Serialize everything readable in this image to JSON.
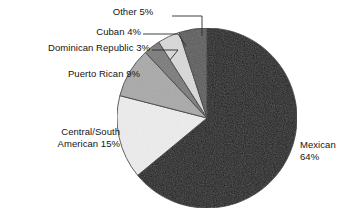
{
  "chart_data": {
    "type": "pie",
    "title": "",
    "subtitle": "",
    "xlabel": "",
    "ylabel": "",
    "grid": false,
    "legend_position": "none",
    "label_format": "{name} {value}%",
    "total": 100,
    "units": "percent",
    "start_angle_deg": 0,
    "direction": "clockwise",
    "categories": [
      "Mexican",
      "Central/South American",
      "Puerto Rican",
      "Dominican Republic",
      "Cuban",
      "Other"
    ],
    "values": [
      64,
      15,
      9,
      3,
      4,
      5
    ],
    "slices": [
      {
        "name": "Mexican",
        "value": 64,
        "value_label": "64%",
        "color": "#1a1a1a",
        "label_line_1": "Mexican",
        "label_line_2": "64%",
        "label_placement": "outside-right",
        "leader_line": false
      },
      {
        "name": "Central/South American",
        "value": 15,
        "value_label": "15%",
        "color": "#ededed",
        "label_line_1": "Central/South",
        "label_line_2": "American 15%",
        "label_placement": "outside-left",
        "leader_line": false
      },
      {
        "name": "Puerto Rican",
        "value": 9,
        "value_label": "9%",
        "color": "#a9a9a9",
        "label_line_1": "Puerto Rican 9%",
        "label_line_2": "",
        "label_placement": "outside-left",
        "leader_line": false
      },
      {
        "name": "Dominican Republic",
        "value": 3,
        "value_label": "3%",
        "color": "#7a7a7a",
        "label_line_1": "Dominican Republic 3%",
        "label_line_2": "",
        "label_placement": "outside-upper-left",
        "leader_line": true
      },
      {
        "name": "Cuban",
        "value": 4,
        "value_label": "4%",
        "color": "#d9d9d9",
        "label_line_1": "Cuban 4%",
        "label_line_2": "",
        "label_placement": "outside-upper-left",
        "leader_line": true
      },
      {
        "name": "Other",
        "value": 5,
        "value_label": "5%",
        "color": "#5c5c5c",
        "label_line_1": "Other 5%",
        "label_line_2": "",
        "label_placement": "outside-top",
        "leader_line": true
      }
    ],
    "geometry": {
      "center_x": 207,
      "center_y": 118,
      "radius": 90
    },
    "colors": {
      "background": "#ffffff",
      "text": "#141414",
      "outline": "#2b2b2b",
      "leader": "#2b2b2b"
    }
  },
  "labels": {
    "other": {
      "line1": "Other 5%"
    },
    "cuban": {
      "line1": "Cuban 4%"
    },
    "dominican_republic": {
      "line1": "Dominican Republic 3%"
    },
    "puerto_rican": {
      "line1": "Puerto Rican 9%"
    },
    "central_south_american": {
      "line1": "Central/South",
      "line2": "American 15%"
    },
    "mexican": {
      "line1": "Mexican",
      "line2": "64%"
    }
  }
}
